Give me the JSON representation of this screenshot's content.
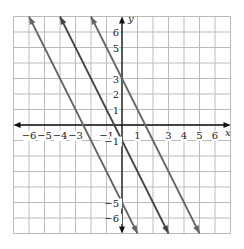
{
  "chart_data": {
    "type": "line",
    "title": "",
    "xlabel": "x",
    "ylabel": "y",
    "xlim": [
      -7,
      7
    ],
    "ylim": [
      -7,
      7
    ],
    "grid": true,
    "x_ticks": [
      "-6",
      "-5",
      "-4",
      "-3",
      "-1",
      "1",
      "3",
      "4",
      "5",
      "6"
    ],
    "y_ticks": [
      "6",
      "5",
      "3",
      "2",
      "1",
      "-1",
      "-5",
      "-6"
    ],
    "series": [
      {
        "name": "y = -2x - 5",
        "slope": -2,
        "intercept": -5,
        "color": "#666666"
      },
      {
        "name": "y = -2x - 1",
        "slope": -2,
        "intercept": -1,
        "color": "#444444"
      },
      {
        "name": "y = -2x + 3",
        "slope": -2,
        "intercept": 3,
        "color": "#666666"
      }
    ]
  },
  "labels": {
    "x_axis": "x",
    "y_axis": "y"
  }
}
